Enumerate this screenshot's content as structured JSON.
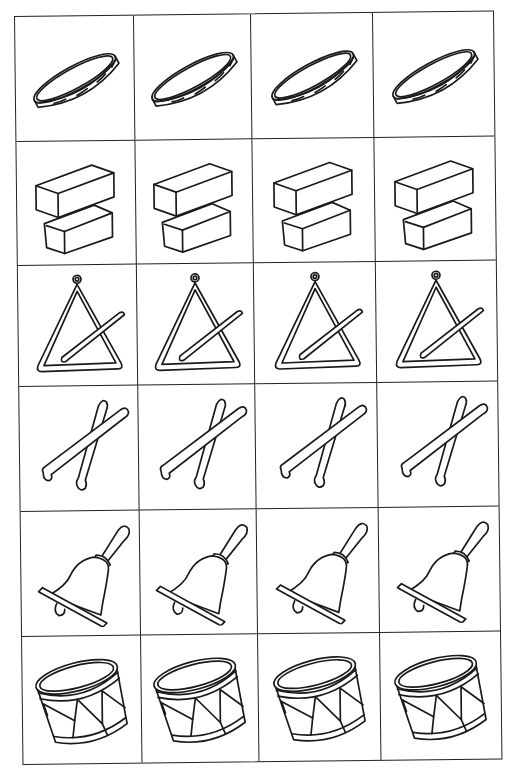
{
  "sheet": {
    "rows": 6,
    "columns": 4,
    "ink_color": "#1a1a1a",
    "background": "#ffffff",
    "instruments": [
      {
        "row": 1,
        "name": "tambourine",
        "label": "Tambourine",
        "count": 4
      },
      {
        "row": 2,
        "name": "wood-blocks",
        "label": "Wood blocks",
        "count": 4
      },
      {
        "row": 3,
        "name": "triangle",
        "label": "Triangle",
        "count": 4
      },
      {
        "row": 4,
        "name": "drumsticks",
        "label": "Drumsticks",
        "count": 4
      },
      {
        "row": 5,
        "name": "hand-bell",
        "label": "Hand bell",
        "count": 4
      },
      {
        "row": 6,
        "name": "drum",
        "label": "Drum",
        "count": 4
      }
    ]
  }
}
